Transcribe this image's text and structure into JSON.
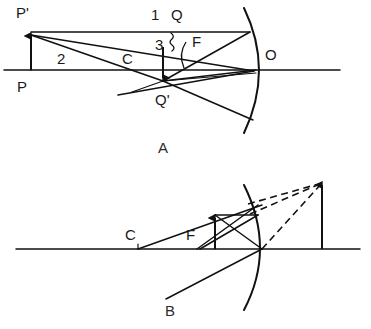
{
  "figure": {
    "background_color": "#ffffff",
    "ink_color": "#111111",
    "width": 371,
    "height": 329
  },
  "panels": [
    {
      "id": "panel-a",
      "caption": "A",
      "caption_x": 163,
      "caption_y": 153,
      "description": "Concave mirror with extended object P P-prime beyond the centre of curvature; rays converge to image point Q Q-prime.",
      "axis": {
        "x1": 4,
        "y1": 70,
        "x2": 340,
        "y2": 70
      },
      "mirror": {
        "vertex_x": 258,
        "vertex_y": 70,
        "top_x": 244,
        "top_y": 8,
        "bottom_x": 244,
        "bottom_y": 133
      },
      "object_arrow": {
        "x": 31,
        "base_y": 70,
        "tip_y": 32
      },
      "image_arrow": {
        "x": 163,
        "base_y": 47,
        "tip_y": 81
      },
      "labels": [
        {
          "name": "label-p-prime",
          "text": "P'",
          "x": 16,
          "y": 18,
          "anchor": "start"
        },
        {
          "name": "label-p",
          "text": "P",
          "x": 17,
          "y": 92,
          "anchor": "start"
        },
        {
          "name": "label-two",
          "text": "2",
          "x": 57,
          "y": 64,
          "anchor": "start"
        },
        {
          "name": "label-c",
          "text": "C",
          "x": 122,
          "y": 64,
          "anchor": "start"
        },
        {
          "name": "label-one",
          "text": "1",
          "x": 151,
          "y": 20,
          "anchor": "start"
        },
        {
          "name": "label-q",
          "text": "Q",
          "x": 171,
          "y": 20,
          "anchor": "start"
        },
        {
          "name": "label-three",
          "text": "3",
          "x": 155,
          "y": 50,
          "anchor": "start"
        },
        {
          "name": "label-f",
          "text": "F",
          "x": 192,
          "y": 47,
          "anchor": "start"
        },
        {
          "name": "label-q-prime",
          "text": "Q'",
          "x": 155,
          "y": 105,
          "anchor": "start"
        },
        {
          "name": "label-o",
          "text": "O",
          "x": 265,
          "y": 60,
          "anchor": "start"
        }
      ]
    },
    {
      "id": "panel-b",
      "caption": "B",
      "caption_x": 170,
      "caption_y": 316,
      "description": "Concave mirror with object inside the focal point; reflected rays diverge and the dashed extensions form an enlarged virtual image behind the mirror.",
      "axis": {
        "x1": 16,
        "y1": 249,
        "x2": 360,
        "y2": 249
      },
      "mirror": {
        "vertex_x": 260,
        "vertex_y": 249,
        "top_x": 244,
        "top_y": 185,
        "bottom_x": 244,
        "bottom_y": 310
      },
      "object_arrow": {
        "x": 215,
        "base_y": 249,
        "tip_y": 215
      },
      "virtual_image_arrow": {
        "x": 322,
        "base_y": 249,
        "tip_y": 181
      },
      "labels": [
        {
          "name": "label-c",
          "text": "C",
          "x": 125,
          "y": 240,
          "anchor": "start"
        },
        {
          "name": "label-f",
          "text": "F",
          "x": 186,
          "y": 240,
          "anchor": "start"
        }
      ]
    }
  ]
}
